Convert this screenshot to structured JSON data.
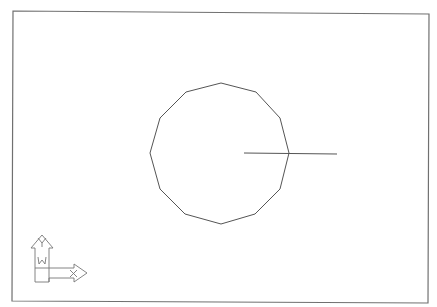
{
  "viewport": {
    "background": "#ffffff",
    "frame_color": "#707070",
    "line_color": "#555555"
  },
  "drawing": {
    "polygon": {
      "sides": 12,
      "center": [
        220,
        153
      ],
      "points": "221,83 256,92 280,118 289,153 280,189 255,214 221,224 185,214 160,189 150,153 160,118 186,92"
    },
    "line": {
      "x1": 244,
      "y1": 153,
      "x2": 337,
      "y2": 154
    }
  },
  "ucs_icon": {
    "y_label": "Y",
    "x_label": "X",
    "w_label": "W"
  }
}
